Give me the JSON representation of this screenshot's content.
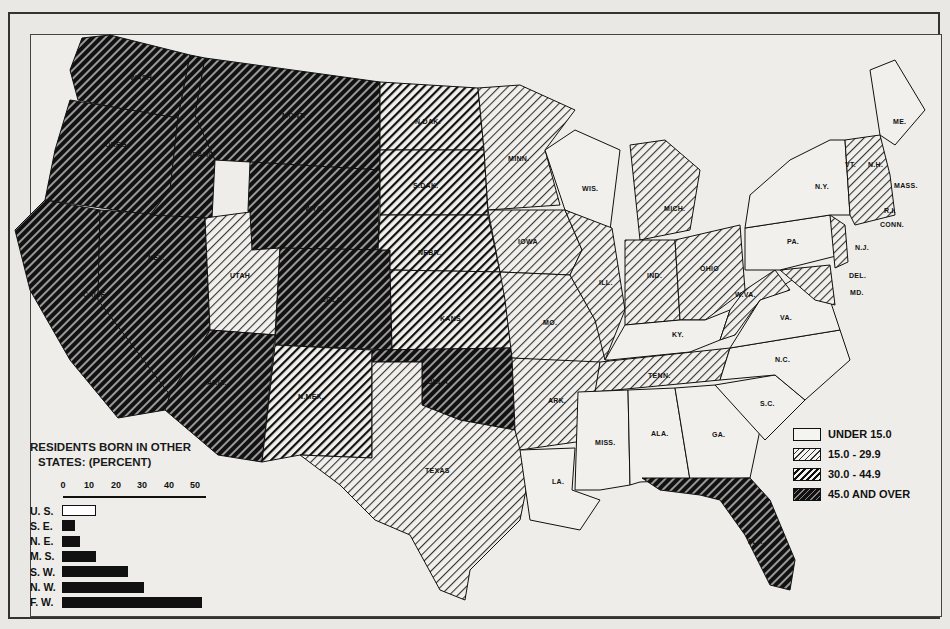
{
  "header": {
    "partial_text": "73"
  },
  "map": {
    "title": "Residents born in other states (percent), by state",
    "states": [
      {
        "abbr": "WASH.",
        "category": 3
      },
      {
        "abbr": "OREG.",
        "category": 3
      },
      {
        "abbr": "CALIF.",
        "category": 3
      },
      {
        "abbr": "NEV.",
        "category": 3
      },
      {
        "abbr": "IDAHO",
        "category": 3
      },
      {
        "abbr": "MONT.",
        "category": 3
      },
      {
        "abbr": "WYO.",
        "category": 3
      },
      {
        "abbr": "UTAH",
        "category": 1
      },
      {
        "abbr": "COLO.",
        "category": 3
      },
      {
        "abbr": "ARIZ.",
        "category": 3
      },
      {
        "abbr": "N.MEX.",
        "category": 2
      },
      {
        "abbr": "N.DAK.",
        "category": 2
      },
      {
        "abbr": "S.DAK.",
        "category": 2
      },
      {
        "abbr": "NEBR.",
        "category": 2
      },
      {
        "abbr": "KANS.",
        "category": 2
      },
      {
        "abbr": "OKLA.",
        "category": 3
      },
      {
        "abbr": "TEXAS",
        "category": 1
      },
      {
        "abbr": "MINN.",
        "category": 1
      },
      {
        "abbr": "IOWA",
        "category": 1
      },
      {
        "abbr": "MO.",
        "category": 1
      },
      {
        "abbr": "ARK.",
        "category": 1
      },
      {
        "abbr": "LA.",
        "category": 0
      },
      {
        "abbr": "WIS.",
        "category": 0
      },
      {
        "abbr": "ILL.",
        "category": 1
      },
      {
        "abbr": "MICH.",
        "category": 1
      },
      {
        "abbr": "IND.",
        "category": 1
      },
      {
        "abbr": "OHIO",
        "category": 1
      },
      {
        "abbr": "KY.",
        "category": 0
      },
      {
        "abbr": "TENN.",
        "category": 1
      },
      {
        "abbr": "MISS.",
        "category": 0
      },
      {
        "abbr": "ALA.",
        "category": 0
      },
      {
        "abbr": "GA.",
        "category": 0
      },
      {
        "abbr": "FLA.",
        "category": 3
      },
      {
        "abbr": "S.C.",
        "category": 0
      },
      {
        "abbr": "N.C.",
        "category": 0
      },
      {
        "abbr": "VA.",
        "category": 0
      },
      {
        "abbr": "W.VA.",
        "category": 1
      },
      {
        "abbr": "MD.",
        "category": 1
      },
      {
        "abbr": "DEL.",
        "category": 1
      },
      {
        "abbr": "PA.",
        "category": 0
      },
      {
        "abbr": "N.J.",
        "category": 1
      },
      {
        "abbr": "N.Y.",
        "category": 0
      },
      {
        "abbr": "CONN.",
        "category": 1
      },
      {
        "abbr": "R.I.",
        "category": 1
      },
      {
        "abbr": "MASS.",
        "category": 1
      },
      {
        "abbr": "VT.",
        "category": 1
      },
      {
        "abbr": "N.H.",
        "category": 1
      },
      {
        "abbr": "ME.",
        "category": 0
      }
    ]
  },
  "legend": {
    "items": [
      {
        "label": "UNDER 15.0",
        "pattern": "blank"
      },
      {
        "label": "15.0 - 29.9",
        "pattern": "light-hatch"
      },
      {
        "label": "30.0 - 44.9",
        "pattern": "medium-hatch"
      },
      {
        "label": "45.0 AND OVER",
        "pattern": "dark-hatch"
      }
    ]
  },
  "inset": {
    "title_line1": "RESIDENTS BORN IN OTHER",
    "title_line2": "STATES: (PERCENT)",
    "ticks": [
      "0",
      "10",
      "20",
      "30",
      "40",
      "50"
    ]
  },
  "chart_data": {
    "type": "bar",
    "orientation": "horizontal",
    "title": "RESIDENTS BORN IN OTHER STATES: (PERCENT)",
    "categories": [
      "U. S.",
      "S. E.",
      "N. E.",
      "M. S.",
      "S. W.",
      "N. W.",
      "F. W."
    ],
    "values": [
      13,
      5,
      7,
      13,
      25,
      31,
      53
    ],
    "xlabel": "",
    "ylabel": "",
    "xlim": [
      0,
      55
    ],
    "xticks": [
      0,
      10,
      20,
      30,
      40,
      50
    ],
    "highlight": {
      "U. S.": "outline"
    },
    "grid": false
  },
  "colors": {
    "paper": "#eeede9",
    "ink": "#111111"
  }
}
